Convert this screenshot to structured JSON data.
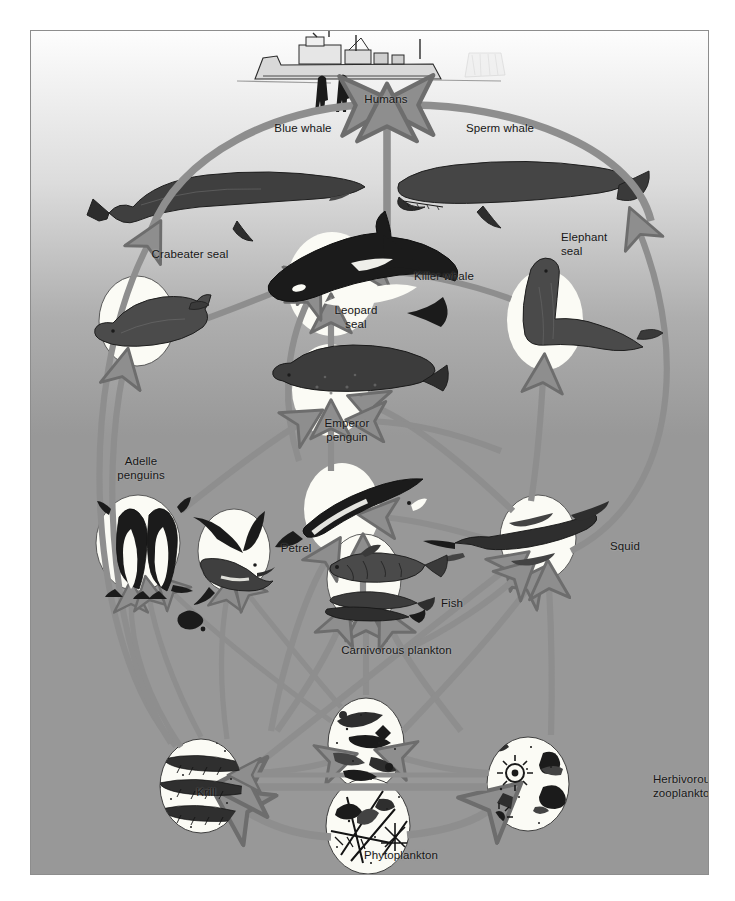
{
  "diagram": {
    "colors": {
      "arrow_fill": "#8e8e8e",
      "arrow_stroke": "#6f6f6f",
      "background_top": "#f7f7f7",
      "background_bottom": "#989898",
      "disc_fill": "#fbfbf7",
      "frame": "#8d8d8d",
      "ink": "#161616"
    },
    "nodes": [
      {
        "id": "humans",
        "label": "Humans",
        "x": 355,
        "y": 104,
        "align": "center",
        "icon": "ship-and-people-icon"
      },
      {
        "id": "blue_whale",
        "label": "Blue whale",
        "x": 272,
        "y": 133,
        "align": "center",
        "icon": "blue-whale-icon"
      },
      {
        "id": "sperm_whale",
        "label": "Sperm whale",
        "x": 469,
        "y": 133,
        "align": "center",
        "icon": "sperm-whale-icon"
      },
      {
        "id": "crabeater",
        "label": "Crabeater seal",
        "x": 159,
        "y": 259,
        "align": "center",
        "icon": "crabeater-seal-icon"
      },
      {
        "id": "killer_whale",
        "label": "Killer whale",
        "x": 413,
        "y": 281,
        "align": "center",
        "icon": "killer-whale-icon"
      },
      {
        "id": "elephant_seal",
        "label": "Elephant\nseal",
        "x": 590,
        "y": 249,
        "align": "left",
        "icon": "elephant-seal-icon"
      },
      {
        "id": "leopard_seal",
        "label": "Leopard\nseal",
        "x": 325,
        "y": 315,
        "align": "center",
        "icon": "leopard-seal-icon"
      },
      {
        "id": "emperor",
        "label": "Emperor\npenguin",
        "x": 316,
        "y": 428,
        "align": "center",
        "icon": "emperor-penguin-icon"
      },
      {
        "id": "adelie",
        "label": "Adelle\npenguins",
        "x": 110,
        "y": 466,
        "align": "center",
        "icon": "adelie-penguins-icon"
      },
      {
        "id": "petrel",
        "label": "Petrel",
        "x": 265,
        "y": 553,
        "align": "center",
        "icon": "petrel-icon"
      },
      {
        "id": "squid",
        "label": "Squid",
        "x": 594,
        "y": 551,
        "align": "center",
        "icon": "squid-icon"
      },
      {
        "id": "fish",
        "label": "Fish",
        "x": 421,
        "y": 608,
        "align": "center",
        "icon": "fish-icon"
      },
      {
        "id": "carniv_plank",
        "label": "Carnivorous plankton",
        "x": 365,
        "y": 655,
        "align": "center",
        "icon": "carnivorous-plankton-icon"
      },
      {
        "id": "krill",
        "label": "Krill",
        "x": 175,
        "y": 797,
        "align": "center",
        "icon": "krill-icon"
      },
      {
        "id": "herb_zoo",
        "label": "Herbivorous\nzooplankton",
        "x": 653,
        "y": 791,
        "align": "center",
        "icon": "herbivorous-zooplankton-icon"
      },
      {
        "id": "phyto",
        "label": "Phytoplankton",
        "x": 370,
        "y": 860,
        "align": "center",
        "icon": "phytoplankton-icon"
      }
    ],
    "edges": [
      {
        "from": "blue_whale",
        "to": "humans"
      },
      {
        "from": "sperm_whale",
        "to": "humans"
      },
      {
        "from": "killer_whale",
        "to": "humans"
      },
      {
        "from": "krill",
        "to": "blue_whale"
      },
      {
        "from": "squid",
        "to": "sperm_whale"
      },
      {
        "from": "crabeater",
        "to": "killer_whale"
      },
      {
        "from": "leopard_seal",
        "to": "killer_whale"
      },
      {
        "from": "elephant_seal",
        "to": "killer_whale"
      },
      {
        "from": "emperor",
        "to": "leopard_seal"
      },
      {
        "from": "adelie",
        "to": "leopard_seal"
      },
      {
        "from": "squid",
        "to": "leopard_seal"
      },
      {
        "from": "krill",
        "to": "crabeater"
      },
      {
        "from": "krill",
        "to": "adelie"
      },
      {
        "from": "krill",
        "to": "petrel"
      },
      {
        "from": "krill",
        "to": "emperor"
      },
      {
        "from": "krill",
        "to": "fish"
      },
      {
        "from": "krill",
        "to": "squid"
      },
      {
        "from": "fish",
        "to": "emperor"
      },
      {
        "from": "fish",
        "to": "adelie"
      },
      {
        "from": "fish",
        "to": "petrel"
      },
      {
        "from": "fish",
        "to": "squid"
      },
      {
        "from": "squid",
        "to": "emperor"
      },
      {
        "from": "squid",
        "to": "elephant_seal"
      },
      {
        "from": "carniv_plank",
        "to": "fish"
      },
      {
        "from": "carniv_plank",
        "to": "squid"
      },
      {
        "from": "carniv_plank",
        "to": "petrel"
      },
      {
        "from": "herb_zoo",
        "to": "carniv_plank"
      },
      {
        "from": "herb_zoo",
        "to": "krill"
      },
      {
        "from": "herb_zoo",
        "to": "fish"
      },
      {
        "from": "phyto",
        "to": "krill"
      },
      {
        "from": "phyto",
        "to": "herb_zoo"
      },
      {
        "from": "krill",
        "to": "carniv_plank"
      }
    ]
  }
}
